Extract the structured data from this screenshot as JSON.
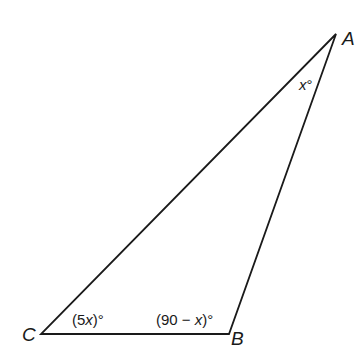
{
  "diagram": {
    "type": "triangle",
    "colors": {
      "stroke": "#1a1a1a",
      "background": "#ffffff"
    },
    "vertices": [
      {
        "id": "A",
        "label": "A",
        "x": 336,
        "y": 34,
        "label_x": 342,
        "label_y": 45
      },
      {
        "id": "B",
        "label": "B",
        "x": 229,
        "y": 334,
        "label_x": 231,
        "label_y": 345
      },
      {
        "id": "C",
        "label": "C",
        "x": 41,
        "y": 334,
        "label_x": 22,
        "label_y": 341
      }
    ],
    "angles": [
      {
        "vertex": "A",
        "prefix": "",
        "var_text": "x",
        "suffix": "°",
        "x": 299,
        "y": 90
      },
      {
        "vertex": "C",
        "prefix": "(5",
        "var_text": "x",
        "suffix": ")°",
        "x": 72,
        "y": 325
      },
      {
        "vertex": "B",
        "prefix": "(90 − ",
        "var_text": "x",
        "suffix": ")°",
        "x": 156,
        "y": 325
      }
    ]
  }
}
